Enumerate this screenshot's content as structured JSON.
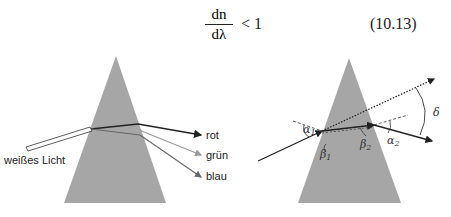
{
  "equation": {
    "numerator": "dn",
    "denominator": "dλ",
    "relation": "< 1",
    "number": "(10.13)"
  },
  "figure_left": {
    "prism_color": "#a6a6a6",
    "labels": {
      "input": "weißes Licht",
      "red": "rot",
      "green": "grün",
      "blue": "blau"
    }
  },
  "figure_right": {
    "prism_color": "#a6a6a6",
    "labels": {
      "alpha1": "α",
      "alpha1_sub": "1",
      "beta1": "β",
      "beta1_sub": "1",
      "beta2": "β",
      "beta2_sub": "2",
      "alpha2": "α",
      "alpha2_sub": "2",
      "delta": "δ"
    }
  }
}
